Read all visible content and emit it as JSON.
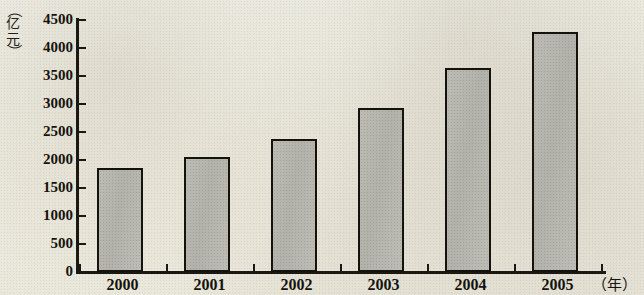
{
  "chart_data": {
    "type": "bar",
    "title": "",
    "subtitle": "",
    "xlabel": "（年）",
    "ylabel": "（亿元）",
    "categories": [
      "2000",
      "2001",
      "2002",
      "2003",
      "2004",
      "2005"
    ],
    "values": [
      1850,
      2060,
      2380,
      2920,
      3640,
      4280
    ],
    "series": [
      {
        "name": "",
        "values": [
          1850,
          2060,
          2380,
          2920,
          3640,
          4280
        ]
      }
    ],
    "ylim": [
      0,
      4500
    ],
    "ytick_values": [
      0,
      500,
      1000,
      1500,
      2000,
      2500,
      3000,
      3500,
      4000,
      4500
    ],
    "ytick_labels": [
      "0",
      "500",
      "1000",
      "1500",
      "2000",
      "2500",
      "3000",
      "3500",
      "4000",
      "4500"
    ],
    "grid": false,
    "legend": false,
    "legend_position": "none",
    "bar_color": "#b8b7b0",
    "bar_edge_color": "#15120d",
    "axis_color": "#1b1813",
    "background_color": "#eceade"
  },
  "axis": {
    "unit_open_paren": "（",
    "unit_char_1": "亿",
    "unit_char_2": "元",
    "unit_close_paren": "）",
    "x_axis_title": "（年）"
  }
}
